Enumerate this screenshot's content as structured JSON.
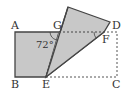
{
  "diagram": {
    "type": "geometry-folded-rectangle",
    "labels": {
      "A": "A",
      "B": "B",
      "C": "C",
      "D": "D",
      "E": "E",
      "F": "F",
      "G": "G"
    },
    "angle_label": "72°",
    "colors": {
      "fill": "#c8c8c8",
      "stroke": "#444444",
      "dashed": "#555555"
    }
  }
}
